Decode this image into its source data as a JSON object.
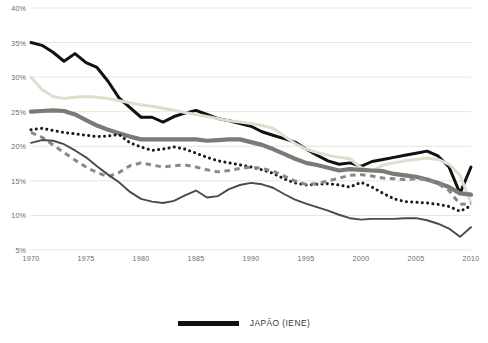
{
  "chart_data": {
    "type": "line",
    "title": "",
    "xlabel": "",
    "ylabel": "",
    "xlim": [
      1970,
      2010
    ],
    "ylim": [
      5,
      40
    ],
    "grid": true,
    "legend_position": "bottom-center",
    "y_ticks": [
      "5%",
      "10%",
      "15%",
      "20%",
      "25%",
      "30%",
      "35%",
      "40%"
    ],
    "y_tick_values": [
      5,
      10,
      15,
      20,
      25,
      30,
      35,
      40
    ],
    "x_ticks": [
      "1970",
      "1975",
      "1980",
      "1985",
      "1990",
      "1995",
      "2000",
      "2005",
      "2010"
    ],
    "x_tick_values": [
      1970,
      1975,
      1980,
      1985,
      1990,
      1995,
      2000,
      2005,
      2010
    ],
    "x": [
      1970,
      1971,
      1972,
      1973,
      1974,
      1975,
      1976,
      1977,
      1978,
      1979,
      1980,
      1981,
      1982,
      1983,
      1984,
      1985,
      1986,
      1987,
      1988,
      1989,
      1990,
      1991,
      1992,
      1993,
      1994,
      1995,
      1996,
      1997,
      1998,
      1999,
      2000,
      2001,
      2002,
      2003,
      2004,
      2005,
      2006,
      2007,
      2008,
      2009,
      2010
    ],
    "series": [
      {
        "name": "JAPÃO (IENE)",
        "legend": true,
        "style": "solid-thick",
        "color": "#111111",
        "width": 3.0,
        "values": [
          35.0,
          34.6,
          33.6,
          32.3,
          33.4,
          32.1,
          31.4,
          29.4,
          27.0,
          25.6,
          24.2,
          24.2,
          23.5,
          24.3,
          24.8,
          25.2,
          24.6,
          24.0,
          23.7,
          23.3,
          22.9,
          22.1,
          21.6,
          21.1,
          20.6,
          19.6,
          18.7,
          17.9,
          17.4,
          17.6,
          17.1,
          17.8,
          18.1,
          18.4,
          18.7,
          19.0,
          19.3,
          18.6,
          17.0,
          13.2,
          17.0
        ]
      },
      {
        "name": "series-cream",
        "legend": false,
        "style": "solid-medium",
        "color": "#e0ddcf",
        "width": 3.0,
        "values": [
          30.0,
          28.2,
          27.2,
          26.9,
          27.1,
          27.2,
          27.1,
          26.9,
          26.6,
          26.3,
          26.0,
          25.8,
          25.5,
          25.2,
          24.9,
          24.6,
          24.3,
          24.0,
          23.7,
          23.5,
          23.3,
          23.0,
          22.6,
          21.5,
          20.4,
          19.6,
          19.1,
          18.7,
          18.4,
          18.2,
          16.9,
          16.4,
          17.3,
          17.6,
          17.9,
          18.1,
          18.3,
          18.1,
          17.4,
          15.8,
          11.8
        ]
      },
      {
        "name": "series-gray-thick",
        "legend": false,
        "style": "solid-thick",
        "color": "#7a7a76",
        "width": 4.2,
        "values": [
          25.0,
          25.1,
          25.2,
          25.1,
          24.6,
          23.8,
          23.0,
          22.4,
          21.9,
          21.4,
          21.0,
          21.0,
          21.0,
          21.0,
          21.0,
          21.0,
          20.8,
          20.9,
          21.0,
          21.0,
          20.6,
          20.2,
          19.6,
          18.9,
          18.2,
          17.6,
          17.3,
          16.9,
          16.5,
          16.7,
          16.6,
          16.5,
          16.4,
          16.0,
          15.8,
          15.6,
          15.2,
          14.7,
          14.1,
          13.2,
          13.0
        ]
      },
      {
        "name": "series-dotted",
        "legend": false,
        "style": "dotted",
        "color": "#1a1a1a",
        "width": 3.0,
        "values": [
          22.4,
          22.6,
          22.3,
          22.0,
          21.8,
          21.6,
          21.4,
          21.5,
          21.7,
          20.5,
          19.9,
          19.4,
          19.6,
          19.9,
          19.6,
          19.0,
          18.4,
          17.9,
          17.6,
          17.3,
          17.0,
          16.6,
          16.1,
          15.3,
          14.7,
          14.4,
          14.5,
          14.6,
          14.4,
          14.1,
          14.8,
          14.1,
          13.2,
          12.4,
          12.0,
          11.9,
          11.8,
          11.6,
          11.3,
          10.6,
          11.4
        ]
      },
      {
        "name": "series-dashed",
        "legend": false,
        "style": "dashed",
        "color": "#8a8a84",
        "width": 3.0,
        "values": [
          22.0,
          21.3,
          20.2,
          19.1,
          18.0,
          17.0,
          16.2,
          15.6,
          16.2,
          17.2,
          17.6,
          17.3,
          17.0,
          17.2,
          17.3,
          17.0,
          16.6,
          16.3,
          16.5,
          16.8,
          17.0,
          16.8,
          16.4,
          15.7,
          15.0,
          14.5,
          14.6,
          15.0,
          15.4,
          15.8,
          15.9,
          15.7,
          15.4,
          15.3,
          15.2,
          15.3,
          15.2,
          14.6,
          13.6,
          11.6,
          11.7
        ]
      },
      {
        "name": "series-thin-dark",
        "legend": false,
        "style": "solid-thin",
        "color": "#4a4a46",
        "width": 1.9,
        "values": [
          20.5,
          20.9,
          20.8,
          20.3,
          19.4,
          18.4,
          17.1,
          15.9,
          14.8,
          13.4,
          12.4,
          12.0,
          11.8,
          12.1,
          12.9,
          13.6,
          12.6,
          12.8,
          13.8,
          14.4,
          14.7,
          14.5,
          14.0,
          13.1,
          12.3,
          11.7,
          11.2,
          10.7,
          10.1,
          9.6,
          9.4,
          9.5,
          9.5,
          9.5,
          9.6,
          9.6,
          9.3,
          8.8,
          8.1,
          6.9,
          8.3
        ]
      }
    ]
  },
  "legend": {
    "entries": [
      {
        "label": "JAPÃO (IENE)",
        "color": "#111111"
      }
    ]
  }
}
